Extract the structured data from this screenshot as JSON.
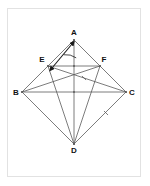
{
  "figure": {
    "background_color": "#ffffff",
    "frame_color": "#e2e2e2",
    "line_color": "#5a5a5a",
    "outline_color": "#6b6b6b",
    "label_color": "#111111",
    "marker_color": "#1a1a1a",
    "points": {
      "A": {
        "label": "A",
        "x": 74,
        "y": 40,
        "label_x": 74,
        "label_y": 35
      },
      "B": {
        "label": "B",
        "x": 22,
        "y": 92,
        "label_x": 16,
        "label_y": 95
      },
      "C": {
        "label": "C",
        "x": 126,
        "y": 92,
        "label_x": 132,
        "label_y": 95
      },
      "D": {
        "label": "D",
        "x": 74,
        "y": 144,
        "label_x": 74,
        "label_y": 153
      },
      "E": {
        "label": "E",
        "x": 48,
        "y": 66,
        "label_x": 42,
        "label_y": 62
      },
      "F": {
        "label": "F",
        "x": 100,
        "y": 66,
        "label_x": 104,
        "label_y": 62
      },
      "O": {
        "label": "",
        "x": 74,
        "y": 92,
        "label_x": 0,
        "label_y": 0
      },
      "M": {
        "label": "",
        "x": 74,
        "y": 66,
        "label_x": 0,
        "label_y": 0
      }
    },
    "segments": [
      {
        "name": "side-AB",
        "from": "A",
        "to": "B",
        "style": "solid"
      },
      {
        "name": "side-BD",
        "from": "B",
        "to": "D",
        "style": "solid"
      },
      {
        "name": "side-DC",
        "from": "D",
        "to": "C",
        "style": "solid"
      },
      {
        "name": "side-CA",
        "from": "C",
        "to": "A",
        "style": "solid"
      },
      {
        "name": "diagonal-AD",
        "from": "A",
        "to": "D",
        "style": "solid"
      },
      {
        "name": "diagonal-BC",
        "from": "B",
        "to": "C",
        "style": "solid"
      },
      {
        "name": "midline-EF",
        "from": "E",
        "to": "F",
        "style": "solid"
      },
      {
        "name": "cevian-DE",
        "from": "D",
        "to": "E",
        "style": "solid"
      },
      {
        "name": "cevian-DF",
        "from": "D",
        "to": "F",
        "style": "solid"
      },
      {
        "name": "cevian-EC",
        "from": "E",
        "to": "C",
        "style": "solid"
      },
      {
        "name": "cevian-BF",
        "from": "B",
        "to": "F",
        "style": "solid"
      }
    ],
    "tick_marks": [
      {
        "name": "tick-on-DC",
        "x": 106,
        "y": 113,
        "angle": 45
      },
      {
        "name": "tick-on-center",
        "x": 84,
        "y": 78,
        "angle": 45
      }
    ],
    "arrow": {
      "name": "double-arrow-EA",
      "from_x": 52,
      "from_y": 68,
      "to_x": 72,
      "to_y": 44,
      "label": ""
    },
    "arc_marker": {
      "name": "angle-arc-at-A",
      "center_x": 74,
      "center_y": 40,
      "radius": 18
    }
  }
}
